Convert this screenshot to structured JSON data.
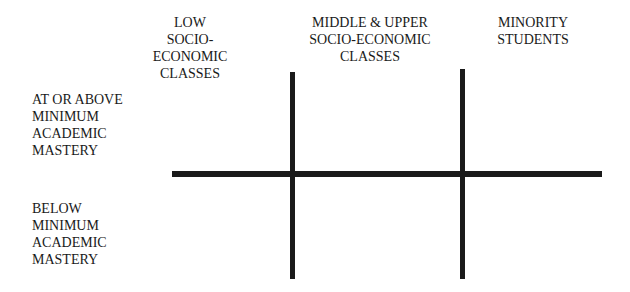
{
  "columns": [
    {
      "label": "LOW\nSOCIO-ECONOMIC\nCLASSES"
    },
    {
      "label": "MIDDLE & UPPER\nSOCIO-ECONOMIC\nCLASSES"
    },
    {
      "label": "MINORITY\nSTUDENTS"
    }
  ],
  "rows": [
    {
      "label": "AT OR ABOVE\nMINIMUM\nACADEMIC\nMASTERY"
    },
    {
      "label": "BELOW\nMINIMUM\nACADEMIC\nMASTERY"
    }
  ],
  "colors": {
    "line": "#1a1a1a",
    "text": "#1a1a1a",
    "background": "#ffffff"
  }
}
